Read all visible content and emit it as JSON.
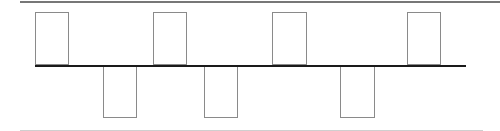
{
  "diagram": {
    "type": "square-wave pulse diagram",
    "colors": {
      "top_border": "#777777",
      "bottom_border": "#cfcfcf",
      "baseline": "#1a1a1a",
      "box_stroke": "#8a8a8a"
    },
    "top_border": {
      "x1": 20,
      "x2": 500,
      "y": 1
    },
    "bottom_border": {
      "x1": 20,
      "x2": 483,
      "y": 130
    },
    "baseline": {
      "x1": 35,
      "x2": 466,
      "y": 65
    },
    "pulses": [
      {
        "direction": "up",
        "x": 35,
        "width": 34,
        "top": 12,
        "height": 53
      },
      {
        "direction": "down",
        "x": 103,
        "width": 34,
        "top": 65,
        "height": 53
      },
      {
        "direction": "up",
        "x": 153,
        "width": 34,
        "top": 12,
        "height": 53
      },
      {
        "direction": "down",
        "x": 204,
        "width": 34,
        "top": 65,
        "height": 53
      },
      {
        "direction": "up",
        "x": 272,
        "width": 35,
        "top": 12,
        "height": 53
      },
      {
        "direction": "down",
        "x": 340,
        "width": 35,
        "top": 65,
        "height": 53
      },
      {
        "direction": "up",
        "x": 407,
        "width": 34,
        "top": 12,
        "height": 53
      }
    ]
  }
}
